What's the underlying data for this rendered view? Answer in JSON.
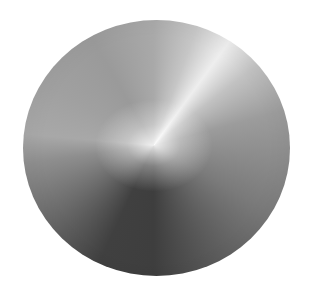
{
  "image": {
    "subject": "metallic-gradient-disc",
    "colors": {
      "background": "#ffffff",
      "highlight": "#f4f4f4",
      "mid_gray": "#a9a9a9",
      "dark_shadow": "#3e3e3e"
    }
  }
}
